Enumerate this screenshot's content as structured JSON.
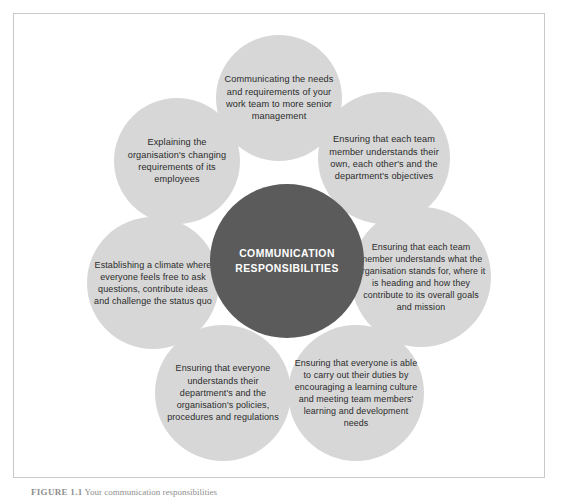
{
  "figure": {
    "hub": {
      "label": "COMMUNICATION RESPONSIBILITIES",
      "color": "#5b5b5b",
      "text_color": "#ffffff"
    },
    "petal_color": "#d7d7d7",
    "petal_text_color": "#2b2b2b",
    "frame_border_color": "#c9c9c9",
    "petals": [
      {
        "position": "top",
        "text": "Communicating the needs and requirements of your work team to more senior management"
      },
      {
        "position": "top-right",
        "text": "Ensuring that each team member understands their own, each other's and the department's objectives"
      },
      {
        "position": "right",
        "text": "Ensuring that each team member understands what the organisation stands for, where it is heading and how they contribute to its overall goals and mission"
      },
      {
        "position": "bottom-right",
        "text": "Ensuring that everyone is able to carry out their duties by encouraging a learning culture and meeting team members' learning and development needs"
      },
      {
        "position": "bottom-left",
        "text": "Ensuring that everyone understands their department's and the organisation's policies, procedures and regulations"
      },
      {
        "position": "left",
        "text": "Establishing a climate where everyone feels free to ask questions, contribute ideas and challenge the status quo"
      },
      {
        "position": "top-left",
        "text": "Explaining the organisation's changing requirements of its employees"
      }
    ],
    "caption": {
      "label": "FIGURE 1.1",
      "text": "Your communication responsibilities"
    }
  }
}
